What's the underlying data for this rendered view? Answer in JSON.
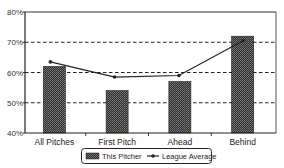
{
  "chart_data": {
    "type": "bar",
    "title": "",
    "xlabel": "",
    "ylabel": "",
    "categories": [
      "All Pitches",
      "First Pitch",
      "Ahead",
      "Behind"
    ],
    "series": [
      {
        "name": "This Pitcher",
        "kind": "bar",
        "values": [
          62,
          54,
          57,
          72
        ]
      },
      {
        "name": "League Average",
        "kind": "line",
        "values": [
          63.5,
          58.5,
          59,
          70.5
        ]
      }
    ],
    "ylim": [
      40,
      80
    ],
    "yticks": [
      40,
      50,
      60,
      70,
      80
    ],
    "ytick_labels": [
      "40%",
      "50%",
      "60%",
      "70%",
      "80%"
    ],
    "grid": {
      "y": true,
      "style": "dashed",
      "lines_at": [
        50,
        60,
        70
      ]
    },
    "legend": {
      "position": "bottom",
      "entries": [
        "This Pitcher",
        "League Average"
      ]
    },
    "colors": {
      "bar": "#3a3a3a",
      "line": "#222222",
      "grid": "#222222",
      "axis": "#222222"
    }
  }
}
